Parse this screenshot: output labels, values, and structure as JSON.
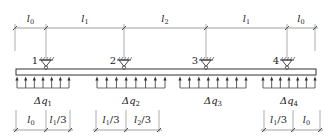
{
  "top_dimensions": [
    {
      "label": "l",
      "sub": "0",
      "x1": 15,
      "x2": 46
    },
    {
      "label": "l",
      "sub": "1",
      "x1": 46,
      "x2": 124
    },
    {
      "label": "l",
      "sub": "2",
      "x1": 124,
      "x2": 206
    },
    {
      "label": "l",
      "sub": "1",
      "x1": 206,
      "x2": 287
    },
    {
      "label": "l",
      "sub": "0",
      "x1": 287,
      "x2": 315
    }
  ],
  "supports": [
    {
      "id": "1",
      "x": 46
    },
    {
      "id": "2",
      "x": 124
    },
    {
      "id": "3",
      "x": 206
    },
    {
      "id": "4",
      "x": 287
    }
  ],
  "beam": {
    "x1": 16,
    "x2": 316,
    "y_top": 69,
    "y_bottom": 75
  },
  "loads": [
    {
      "label": "Δq",
      "sub": "1",
      "x1": 17,
      "x2": 69,
      "arrows": 7
    },
    {
      "label": "Δq",
      "sub": "2",
      "x1": 97,
      "x2": 165,
      "arrows": 8
    },
    {
      "label": "Δq",
      "sub": "3",
      "x1": 180,
      "x2": 246,
      "arrows": 8
    },
    {
      "label": "Δq",
      "sub": "4",
      "x1": 263,
      "x2": 315,
      "arrows": 7
    }
  ],
  "bottom_dimensions": [
    {
      "label": "l",
      "sub": "0",
      "suffix": "",
      "x1": 16,
      "x2": 46
    },
    {
      "label": "l",
      "sub": "1",
      "suffix": "/3",
      "x1": 46,
      "x2": 70
    },
    {
      "label": "l",
      "sub": "1",
      "suffix": "/3",
      "x1": 96,
      "x2": 126
    },
    {
      "label": "l",
      "sub": "2",
      "suffix": "/3",
      "x1": 126,
      "x2": 159
    },
    {
      "label": "l",
      "sub": "1",
      "suffix": "/3",
      "x1": 264,
      "x2": 293
    },
    {
      "label": "l",
      "sub": "0",
      "suffix": "",
      "x1": 293,
      "x2": 320
    }
  ],
  "colors": {
    "line": "#333333",
    "light_line": "#777777"
  }
}
